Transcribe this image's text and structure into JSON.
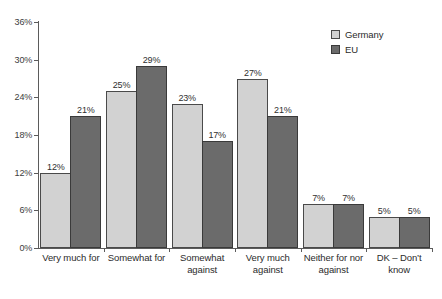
{
  "chart_data": {
    "type": "bar",
    "title": "",
    "xlabel": "",
    "ylabel": "",
    "ylim": [
      0,
      36
    ],
    "yticks": [
      "0%",
      "6%",
      "12%",
      "18%",
      "24%",
      "30%",
      "36%"
    ],
    "ytick_values": [
      0,
      6,
      12,
      18,
      24,
      30,
      36
    ],
    "grid": false,
    "legend_position": "top-right",
    "categories": [
      "Very much for",
      "Somewhat for",
      "Somewhat against",
      "Very much against",
      "Neither for nor against",
      "DK – Don’t know"
    ],
    "series": [
      {
        "name": "Germany",
        "color": "#d2d2d2",
        "values": [
          12,
          25,
          23,
          27,
          7,
          5
        ],
        "labels": [
          "12%",
          "25%",
          "23%",
          "27%",
          "7%",
          "5%"
        ]
      },
      {
        "name": "EU",
        "color": "#6b6b6b",
        "values": [
          21,
          29,
          17,
          21,
          7,
          5
        ],
        "labels": [
          "21%",
          "29%",
          "17%",
          "21%",
          "7%",
          "5%"
        ]
      }
    ]
  },
  "legend": {
    "items": [
      {
        "label": "Germany",
        "swatch": "germany"
      },
      {
        "label": "EU",
        "swatch": "eu"
      }
    ]
  }
}
